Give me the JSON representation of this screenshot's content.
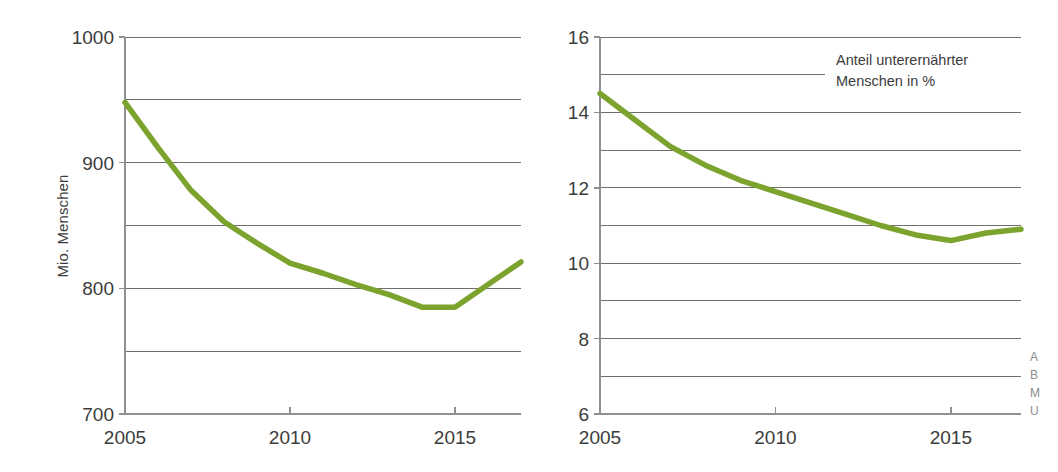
{
  "figure": {
    "background": "#ffffff",
    "line_color": "#7ba32e",
    "axis_color": "#8f8f8f",
    "grid_color": "#6e6e6e",
    "text_color": "#3c3c3c"
  },
  "legend": {
    "line1": "Anteil unterernährter",
    "line2": "Menschen in %"
  },
  "source_note": {
    "line1": "A",
    "line2": "B",
    "line3": "M",
    "line4": "U"
  },
  "chart_data": [
    {
      "type": "line",
      "panel": "left",
      "title": "",
      "xlabel": "",
      "ylabel": "Mio. Menschen",
      "xlim": [
        2005,
        2017
      ],
      "ylim": [
        700,
        1000
      ],
      "ytick_values": [
        700,
        800,
        900,
        1000
      ],
      "ytick_labels": [
        "700",
        "800",
        "900",
        "1000"
      ],
      "ygrid_values": [
        700,
        750,
        800,
        850,
        900,
        950,
        1000
      ],
      "xtick_values": [
        2005,
        2010,
        2015
      ],
      "xtick_labels": [
        "2005",
        "2010",
        "2015"
      ],
      "grid": true,
      "legend_position": "none",
      "series": [
        {
          "name": "Mio. Menschen",
          "color": "#7ba32e",
          "x": [
            2005,
            2006,
            2007,
            2008,
            2009,
            2010,
            2011,
            2012,
            2013,
            2014,
            2015,
            2016,
            2017
          ],
          "values": [
            948,
            912,
            878,
            853,
            836,
            820,
            812,
            803,
            795,
            785,
            785,
            803,
            821
          ]
        }
      ]
    },
    {
      "type": "line",
      "panel": "right",
      "title": "",
      "xlabel": "",
      "ylabel": "",
      "xlim": [
        2005,
        2017
      ],
      "ylim": [
        6,
        16
      ],
      "ytick_values": [
        6,
        8,
        10,
        12,
        14,
        16
      ],
      "ytick_labels": [
        "6",
        "8",
        "10",
        "12",
        "14",
        "16"
      ],
      "ygrid_values": [
        6,
        7,
        8,
        9,
        10,
        11,
        12,
        13,
        14,
        15,
        16
      ],
      "xtick_values": [
        2005,
        2010,
        2015
      ],
      "xtick_labels": [
        "2005",
        "2010",
        "2015"
      ],
      "grid": true,
      "legend_position": "top-right",
      "series": [
        {
          "name": "Anteil unterernährter Menschen in %",
          "color": "#7ba32e",
          "x": [
            2005,
            2006,
            2007,
            2008,
            2009,
            2010,
            2011,
            2012,
            2013,
            2014,
            2015,
            2016,
            2017
          ],
          "values": [
            14.5,
            13.8,
            13.1,
            12.6,
            12.2,
            11.9,
            11.6,
            11.3,
            11.0,
            10.75,
            10.6,
            10.8,
            10.9
          ]
        }
      ]
    }
  ]
}
